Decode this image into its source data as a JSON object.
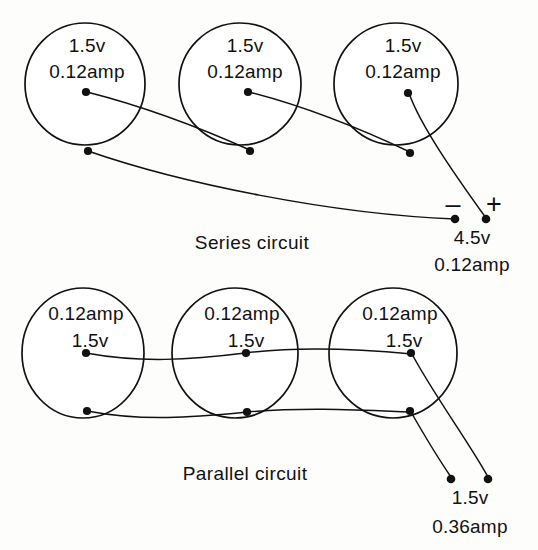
{
  "figure": {
    "type": "electrical-circuit-diagram",
    "background_color": "#fdfdfc",
    "ink_color": "#111111"
  },
  "series_circuit": {
    "caption": "Series circuit",
    "cells": [
      {
        "label_top": "1.5v",
        "label_bottom": "0.12amp"
      },
      {
        "label_top": "1.5v",
        "label_bottom": "0.12amp"
      },
      {
        "label_top": "1.5v",
        "label_bottom": "0.12amp"
      }
    ],
    "output": {
      "negative_sign": "–",
      "positive_sign": "+",
      "voltage": "4.5v",
      "current": "0.12amp"
    }
  },
  "parallel_circuit": {
    "caption": "Parallel circuit",
    "cells": [
      {
        "label_top": "0.12amp",
        "label_bottom": "1.5v"
      },
      {
        "label_top": "0.12amp",
        "label_bottom": "1.5v"
      },
      {
        "label_top": "0.12amp",
        "label_bottom": "1.5v"
      }
    ],
    "output": {
      "voltage": "1.5v",
      "current": "0.36amp"
    }
  }
}
